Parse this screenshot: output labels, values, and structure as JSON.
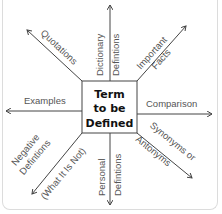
{
  "diagram": {
    "center": {
      "line1": "Term",
      "line2": "to be",
      "line3": "Defined"
    },
    "branches": {
      "top": {
        "line1": "Dictionary",
        "line2": "Defintions"
      },
      "top_right": {
        "line1": "Important",
        "line2": "Facts"
      },
      "right": {
        "line1": "Comparison"
      },
      "bottom_right": {
        "line1": "Synonyms or",
        "line2": "Antonyms"
      },
      "bottom": {
        "line1": "Personal",
        "line2": "Defintions"
      },
      "bottom_left": {
        "line1": "Negative",
        "line2": "Defintions",
        "line3": "(What It Is Not)"
      },
      "left": {
        "line1": "Examples"
      },
      "top_left": {
        "line1": "Quotations"
      }
    },
    "colors": {
      "line": "#444444",
      "label": "#555555",
      "center_text": "#111111",
      "frame": "#dcdcdc"
    }
  }
}
